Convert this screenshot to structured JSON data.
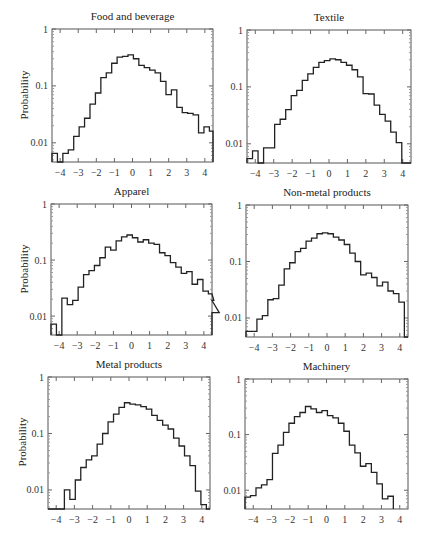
{
  "figure": {
    "ylabel": "Probability",
    "yticks": [
      "1",
      "0.1",
      "0.01"
    ],
    "xticks": [
      "−4",
      "−3",
      "−2",
      "−1",
      "0",
      "1",
      "2",
      "3",
      "4"
    ]
  },
  "chart_data": [
    {
      "type": "bar",
      "title": "Food and beverage",
      "xlabel": "",
      "ylabel": "Probability",
      "yscale": "log",
      "ylim": [
        0.0046,
        1
      ],
      "xlim": [
        -4.45,
        4.45
      ],
      "grid": false,
      "bin_width": 0.3,
      "x_start": -4.45,
      "values": [
        0.0065,
        0.0046,
        0.0065,
        0.0075,
        0.013,
        0.019,
        0.027,
        0.048,
        0.075,
        0.14,
        0.17,
        0.25,
        0.32,
        0.33,
        0.35,
        0.3,
        0.23,
        0.21,
        0.19,
        0.17,
        0.12,
        0.07,
        0.085,
        0.042,
        0.034,
        0.033,
        0.031,
        0.015,
        0.019,
        0.016
      ]
    },
    {
      "type": "bar",
      "title": "Textile",
      "xlabel": "",
      "ylabel": "Probability",
      "yscale": "log",
      "ylim": [
        0.0046,
        1
      ],
      "xlim": [
        -4.45,
        4.45
      ],
      "grid": false,
      "bin_width": 0.3,
      "x_start": -4.45,
      "values": [
        0.0055,
        0.0075,
        0.0046,
        0.0085,
        0.0085,
        0.022,
        0.027,
        0.04,
        0.07,
        0.087,
        0.13,
        0.17,
        0.22,
        0.27,
        0.29,
        0.31,
        0.3,
        0.27,
        0.24,
        0.2,
        0.15,
        0.076,
        0.075,
        0.048,
        0.033,
        0.025,
        0.016,
        0.0105,
        0.0046,
        0.0046
      ]
    },
    {
      "type": "bar",
      "title": "Apparel",
      "xlabel": "",
      "ylabel": "Probability",
      "yscale": "log",
      "ylim": [
        0.0046,
        1
      ],
      "xlim": [
        -4.45,
        4.45
      ],
      "grid": false,
      "bin_width": 0.3,
      "x_start": -4.45,
      "values": [
        0.0072,
        0.0046,
        0.021,
        0.016,
        0.019,
        0.033,
        0.055,
        0.065,
        0.08,
        0.11,
        0.17,
        0.15,
        0.22,
        0.26,
        0.28,
        0.25,
        0.21,
        0.23,
        0.2,
        0.19,
        0.135,
        0.12,
        0.09,
        0.075,
        0.058,
        0.062,
        0.037,
        0.045,
        0.028,
        0.025,
        0.019,
        0.0115
      ]
    },
    {
      "type": "bar",
      "title": "Non-metal products",
      "xlabel": "",
      "ylabel": "Probability",
      "yscale": "log",
      "ylim": [
        0.0046,
        1
      ],
      "xlim": [
        -4.45,
        4.45
      ],
      "grid": false,
      "bin_width": 0.3,
      "x_start": -4.45,
      "values": [
        0.0058,
        0.0058,
        0.0095,
        0.011,
        0.021,
        0.022,
        0.038,
        0.074,
        0.095,
        0.15,
        0.17,
        0.23,
        0.26,
        0.31,
        0.32,
        0.31,
        0.27,
        0.24,
        0.2,
        0.14,
        0.1,
        0.058,
        0.062,
        0.052,
        0.037,
        0.043,
        0.03,
        0.027,
        0.019,
        0.0046
      ]
    },
    {
      "type": "bar",
      "title": "Metal products",
      "xlabel": "",
      "ylabel": "Probability",
      "yscale": "log",
      "ylim": [
        0.0046,
        1
      ],
      "xlim": [
        -4.45,
        4.45
      ],
      "grid": false,
      "bin_width": 0.3,
      "x_start": -4.45,
      "values": [
        0.0046,
        0.0046,
        0.0046,
        0.01,
        0.0068,
        0.015,
        0.025,
        0.034,
        0.04,
        0.065,
        0.1,
        0.16,
        0.22,
        0.29,
        0.35,
        0.33,
        0.32,
        0.3,
        0.27,
        0.21,
        0.17,
        0.14,
        0.12,
        0.083,
        0.06,
        0.04,
        0.027,
        0.0095,
        0.0055,
        0.0046
      ]
    },
    {
      "type": "bar",
      "title": "Machinery",
      "xlabel": "",
      "ylabel": "Probability",
      "yscale": "log",
      "ylim": [
        0.0046,
        1
      ],
      "xlim": [
        -4.45,
        4.45
      ],
      "grid": false,
      "bin_width": 0.3,
      "x_start": -4.45,
      "values": [
        0.0075,
        0.008,
        0.011,
        0.0125,
        0.0155,
        0.046,
        0.065,
        0.11,
        0.16,
        0.21,
        0.25,
        0.32,
        0.29,
        0.25,
        0.27,
        0.22,
        0.2,
        0.16,
        0.115,
        0.065,
        0.047,
        0.027,
        0.03,
        0.021,
        0.013,
        0.007,
        0.0078
      ]
    }
  ],
  "panels": [
    {
      "title": "Food and beverage",
      "show_ylabel": true
    },
    {
      "title": "Textile",
      "show_ylabel": false
    },
    {
      "title": "Apparel",
      "show_ylabel": true
    },
    {
      "title": "Non-metal products",
      "show_ylabel": false
    },
    {
      "title": "Metal products",
      "show_ylabel": true
    },
    {
      "title": "Machinery",
      "show_ylabel": false
    }
  ]
}
